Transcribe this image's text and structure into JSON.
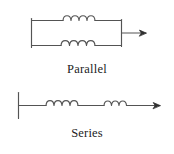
{
  "figure": {
    "background_color": "#ffffff",
    "line_color": "#545454",
    "text_color": "#1c1c1c"
  },
  "diagrams": [
    {
      "id": "parallel",
      "caption": "Parallel",
      "description": "Two inductors connected in parallel between a left vertical bar and a right vertical bar, with an output arrow to the right",
      "branches": [
        {
          "id": "top-branch",
          "coil_turns": 4,
          "label": "upper inductor"
        },
        {
          "id": "bottom-branch",
          "coil_turns": 4,
          "label": "lower inductor"
        }
      ],
      "arrow": {
        "direction": "right",
        "label": "output"
      }
    },
    {
      "id": "series",
      "caption": "Series",
      "description": "Two inductors connected in series along a single horizontal wire starting at a left vertical bar and ending with an arrow to the right",
      "branches": [
        {
          "id": "first-inductor",
          "coil_turns": 4,
          "label": "first inductor"
        },
        {
          "id": "second-inductor",
          "coil_turns": 3,
          "label": "second inductor"
        }
      ],
      "arrow": {
        "direction": "right",
        "label": "output"
      }
    }
  ]
}
